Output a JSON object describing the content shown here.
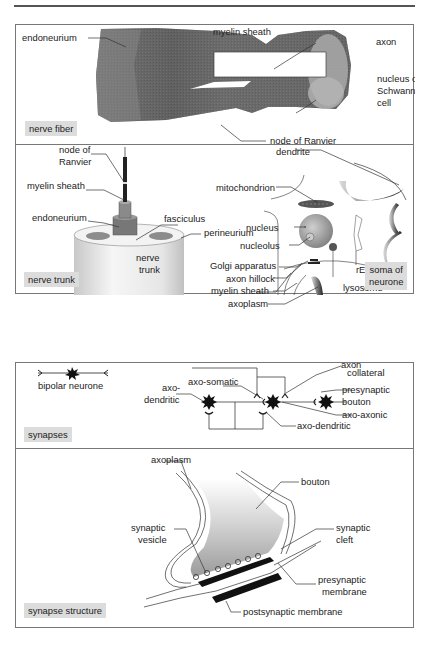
{
  "panels": {
    "nerve_fiber": {
      "tag": "nerve fiber",
      "labels": {
        "endoneurium": "endoneurium",
        "myelin_sheath": "myelin sheath",
        "axon": "axon",
        "nucleus_of": "nucleus of",
        "schwann": "Schwann",
        "cell": "cell",
        "node_of_ranvier": "node of Ranvier"
      }
    },
    "nerve_trunk": {
      "tag": "nerve trunk",
      "labels": {
        "node_of": "node of",
        "ranvier": "Ranvier",
        "myelin_sheath": "myelin sheath",
        "endoneurium": "endoneurium",
        "fasciculus": "fasciculus",
        "perineurium": "perineurium",
        "nerve": "nerve",
        "trunk": "trunk"
      }
    },
    "soma": {
      "tag_line1": "soma of",
      "tag_line2": "neurone",
      "labels": {
        "dendrite": "dendrite",
        "mitochondrion": "mitochondrion",
        "nucleus": "nucleus",
        "nucleolus": "nucleolus",
        "golgi": "Golgi apparatus",
        "axon_hillock": "axon hillock",
        "myelin_sheath": "myelin sheath",
        "axoplasm": "axoplasm",
        "rer": "rER",
        "lysosome": "lysosome"
      }
    },
    "synapses": {
      "tag": "synapses",
      "labels": {
        "bipolar_neurone": "bipolar neurone",
        "axo": "axo-",
        "dendritic": "dendritic",
        "axo_somatic": "axo-somatic",
        "axo_dendritic": "axo-dendritic",
        "axon": "axon",
        "collateral": "collateral",
        "presynaptic": "presynaptic",
        "bouton": "bouton",
        "axo_axonic": "axo-axonic"
      }
    },
    "synapse_structure": {
      "tag": "synapse structure",
      "labels": {
        "axoplasm": "axoplasm",
        "bouton": "bouton",
        "synaptic": "synaptic",
        "vesicle": "vesicle",
        "synaptic2": "synaptic",
        "cleft": "cleft",
        "presynaptic": "presynaptic",
        "membrane": "membrane",
        "postsynaptic_membrane": "postsynaptic membrane"
      }
    }
  }
}
